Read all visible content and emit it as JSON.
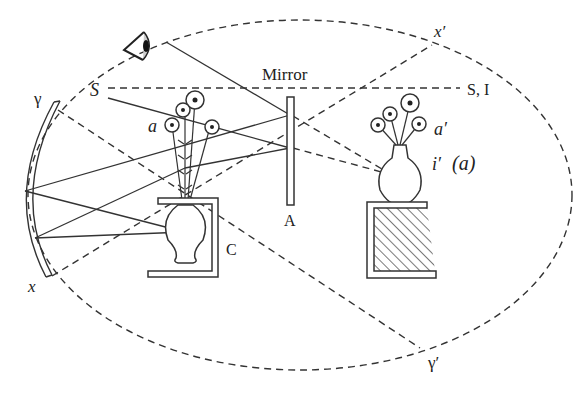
{
  "diagram": {
    "type": "optics-illusion-setup",
    "labels": {
      "mirror": "Mirror",
      "s_i": "S, I",
      "s": "S",
      "gamma": "γ",
      "gamma_prime": "γ′",
      "x": "x",
      "x_prime": "x′",
      "a": "a",
      "a_prime": "a′",
      "i_prime": "i′",
      "i_prime_paren": "(a)",
      "A": "A",
      "C": "C"
    },
    "elements": [
      "observer eye",
      "concave mirror arc γ–x",
      "plane mirror A",
      "real flowers a (upside-down, hidden)",
      "vase in box C",
      "image flowers a′ in vase i′ on stand",
      "dashed ellipse boundary",
      "dashed sight line S–S,I",
      "dashed x–x′ and γ–γ′ lines"
    ],
    "colors": {
      "stroke": "#333333",
      "background": "#ffffff"
    }
  }
}
